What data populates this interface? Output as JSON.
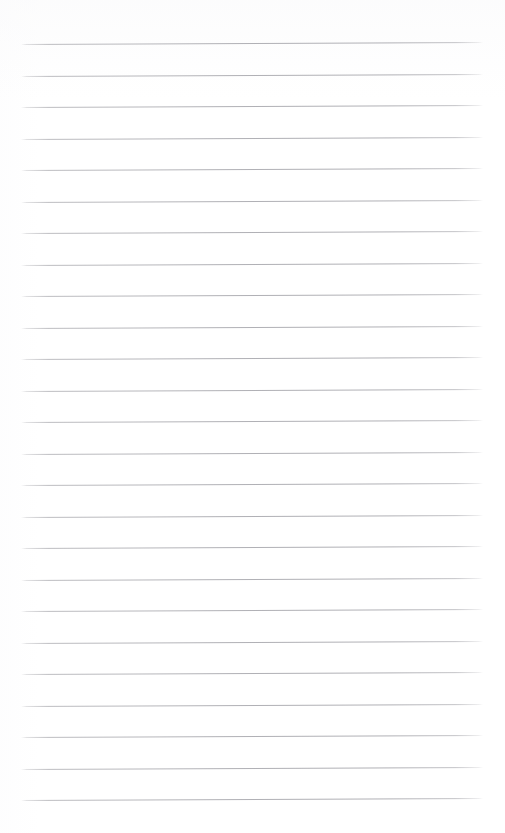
{
  "document": {
    "kind": "lined-paper",
    "description": "Blank ruled notebook page",
    "text_content": "",
    "canvas": {
      "width_px": 505,
      "height_px": 833,
      "background_color": "#ffffff"
    },
    "ruling": {
      "line_count": 25,
      "line_color": "#b0b0b5",
      "line_thickness_px": 1,
      "first_line_y_px": 44,
      "line_spacing_px": 31.5,
      "last_line_y_px": 800,
      "left_margin_px": 21,
      "right_edge_px": 483,
      "line_length_px": 462,
      "tilt_degrees": -0.25,
      "margin_rule": "none",
      "holes": "none"
    },
    "lines": [
      {
        "index": 1,
        "y_px": 44.0,
        "content": ""
      },
      {
        "index": 2,
        "y_px": 75.5,
        "content": ""
      },
      {
        "index": 3,
        "y_px": 107.0,
        "content": ""
      },
      {
        "index": 4,
        "y_px": 138.5,
        "content": ""
      },
      {
        "index": 5,
        "y_px": 170.0,
        "content": ""
      },
      {
        "index": 6,
        "y_px": 201.5,
        "content": ""
      },
      {
        "index": 7,
        "y_px": 233.0,
        "content": ""
      },
      {
        "index": 8,
        "y_px": 264.5,
        "content": ""
      },
      {
        "index": 9,
        "y_px": 296.0,
        "content": ""
      },
      {
        "index": 10,
        "y_px": 327.5,
        "content": ""
      },
      {
        "index": 11,
        "y_px": 359.0,
        "content": ""
      },
      {
        "index": 12,
        "y_px": 390.5,
        "content": ""
      },
      {
        "index": 13,
        "y_px": 422.0,
        "content": ""
      },
      {
        "index": 14,
        "y_px": 453.5,
        "content": ""
      },
      {
        "index": 15,
        "y_px": 485.0,
        "content": ""
      },
      {
        "index": 16,
        "y_px": 516.5,
        "content": ""
      },
      {
        "index": 17,
        "y_px": 548.0,
        "content": ""
      },
      {
        "index": 18,
        "y_px": 579.5,
        "content": ""
      },
      {
        "index": 19,
        "y_px": 611.0,
        "content": ""
      },
      {
        "index": 20,
        "y_px": 642.5,
        "content": ""
      },
      {
        "index": 21,
        "y_px": 674.0,
        "content": ""
      },
      {
        "index": 22,
        "y_px": 705.5,
        "content": ""
      },
      {
        "index": 23,
        "y_px": 737.0,
        "content": ""
      },
      {
        "index": 24,
        "y_px": 768.5,
        "content": ""
      },
      {
        "index": 25,
        "y_px": 800.0,
        "content": ""
      }
    ]
  }
}
